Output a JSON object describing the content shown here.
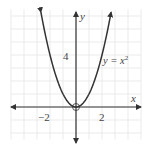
{
  "chart_data": {
    "type": "line",
    "title": "",
    "xlabel": "x",
    "ylabel": "y",
    "function": "y = x^2",
    "curve_label": "y = x²",
    "xlim": [
      -5,
      5
    ],
    "ylim": [
      -2.5,
      7.5
    ],
    "grid": true,
    "x_tick_labels": [
      {
        "value": -2,
        "label": "−2"
      },
      {
        "value": 2,
        "label": "2"
      }
    ],
    "y_tick_labels": [
      {
        "value": 4,
        "label": "4"
      }
    ],
    "series": [
      {
        "name": "y = x^2",
        "x": [
          -2.7,
          -2,
          -1,
          0,
          1,
          2,
          2.7
        ],
        "y": [
          7.29,
          4,
          1,
          0,
          1,
          4,
          7.29
        ]
      }
    ],
    "annotations": [
      {
        "type": "open-circle",
        "x": 0,
        "y": 0,
        "note": "vertex highlighted at origin"
      }
    ],
    "colors": {
      "grid": "#e6e6e6",
      "axis": "#333333",
      "curve": "#333333",
      "text": "#444444"
    }
  },
  "labels": {
    "x_axis": "x",
    "y_axis": "y",
    "curve_prefix": "y = x",
    "curve_exp": "2",
    "tick_x_neg2": "−2",
    "tick_x_2": "2",
    "tick_y_4": "4"
  }
}
